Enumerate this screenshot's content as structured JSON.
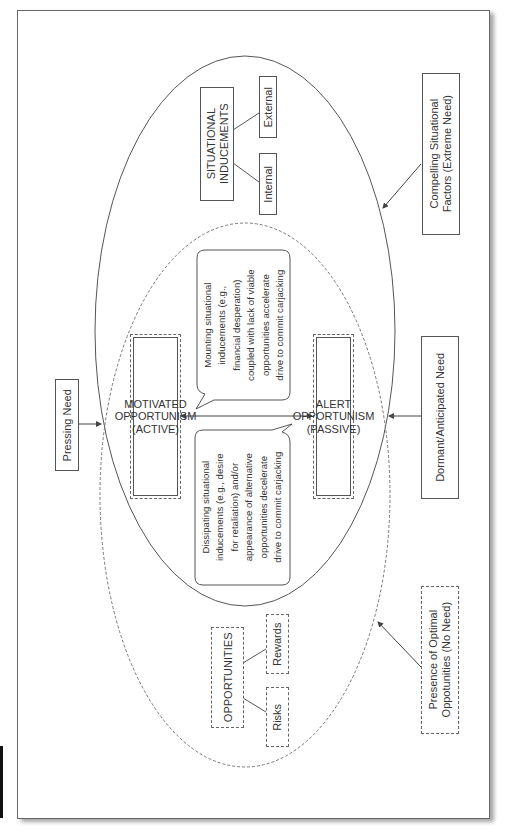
{
  "diagram": {
    "orientation": "rotated -90 degrees (text reads bottom-to-top)",
    "outer_ellipse": {
      "label": "SITUATIONAL INDUCEMENTS",
      "children": [
        "Internal",
        "External"
      ],
      "stroke": "solid"
    },
    "inner_ellipse": {
      "label": "OPPORTUNITIES",
      "children": [
        "Risks",
        "Rewards"
      ],
      "stroke": "dashed"
    },
    "states": {
      "motivated": {
        "line1": "MOTIVATED OPPORTUNISM",
        "line2": "(ACTIVE)"
      },
      "alert": {
        "line1": "ALERT OPPORTUNISM",
        "line2": "(PASSIVE)"
      }
    },
    "bubbles": {
      "mounting": {
        "lines": [
          "Mounting situational",
          "inducements (e.g.,",
          "financial desperation)",
          "coupled with lack of viable",
          "opportunities accelerate",
          "drive to commit carjacking"
        ]
      },
      "dissipating": {
        "lines": [
          "Dissipating situational",
          "inducements (e.g., desire",
          "for retaliation) and/or",
          "appearance of alternative",
          "opportunities decelerate",
          "drive to commit carjacking"
        ]
      }
    },
    "external_labels": {
      "pressing": "Pressing Need",
      "compelling": {
        "line1": "Compelling Situational",
        "line2": "Factors (Extreme Need)"
      },
      "dormant": "Dormant/Anticipated Need",
      "presence": {
        "line1": "Presence of Optimal",
        "line2": "Oppotunities (No Need)"
      }
    }
  }
}
